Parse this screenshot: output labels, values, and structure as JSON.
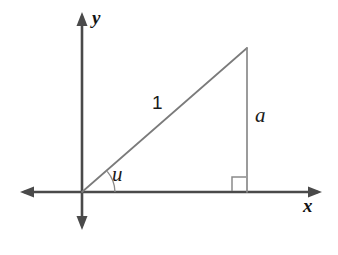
{
  "figure": {
    "background_color": "#ffffff",
    "axis_color": "#4a4a4a",
    "triangle_color": "#7b7b7b",
    "label_color": "#1a1a1a"
  },
  "axes": {
    "x_label": "x",
    "y_label": "y",
    "origin": {
      "x": 82,
      "y": 192
    },
    "x_axis": {
      "start_x": 20,
      "end_x": 322,
      "y": 192
    },
    "y_axis": {
      "x": 82,
      "start_y": 12,
      "end_y": 230
    }
  },
  "triangle": {
    "vertices": {
      "origin": {
        "x": 82,
        "y": 192
      },
      "apex": {
        "x": 247,
        "y": 48
      },
      "foot": {
        "x": 247,
        "y": 192
      }
    },
    "hypotenuse_label": "1",
    "opposite_leg_label": "a",
    "angle_label": "u",
    "right_angle_marker": true,
    "right_angle_marker_size": 14,
    "angle_arc_radius": 33
  },
  "labels": [
    {
      "name": "y-axis-label",
      "text": "y",
      "style": "bold-italic"
    },
    {
      "name": "x-axis-label",
      "text": "x",
      "style": "bold-italic"
    },
    {
      "name": "hypotenuse-length-label",
      "text": "1",
      "style": "upright"
    },
    {
      "name": "opposite-side-label",
      "text": "a",
      "style": "italic"
    },
    {
      "name": "angle-label",
      "text": "u",
      "style": "italic"
    }
  ]
}
